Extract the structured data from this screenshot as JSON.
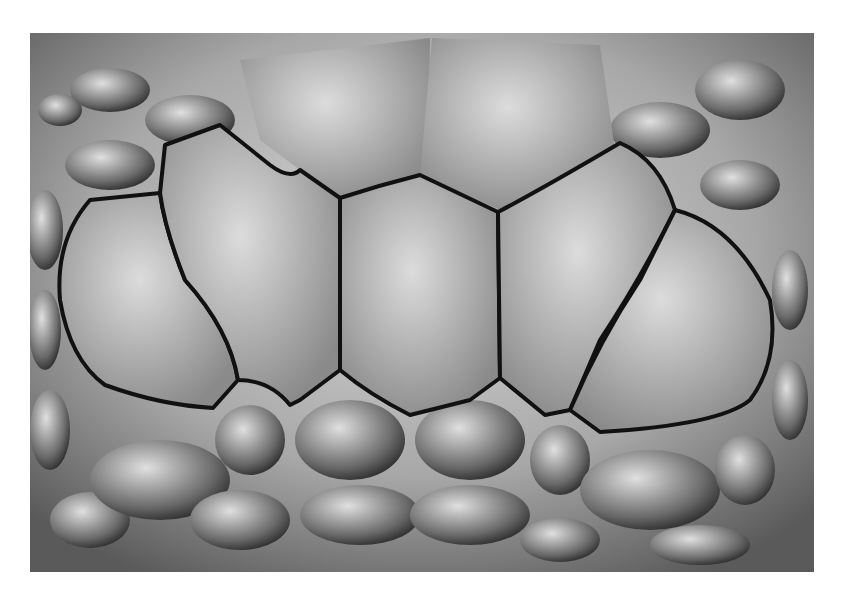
{
  "image": {
    "subject": "Close-up of reptile head scales with five scutes outlined in black",
    "style": "grayscale photograph",
    "outlined_scutes": 5,
    "colors": {
      "background": "#ffffff",
      "outline": "#111111",
      "scale_light": "#cfcfcf",
      "scale_mid": "#9a9a9a",
      "scale_dark": "#3a3a3a"
    }
  }
}
